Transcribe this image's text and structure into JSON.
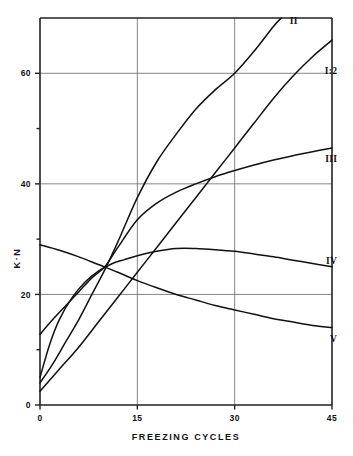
{
  "chart_data": {
    "type": "line",
    "title": "",
    "xlabel": "FREEZING CYCLES",
    "ylabel": "K·N",
    "xlim": [
      0,
      45
    ],
    "ylim": [
      0,
      70
    ],
    "grid": true,
    "legend_position": "right-inline-labels",
    "xticks": [
      {
        "value": 0,
        "label": "0"
      },
      {
        "value": 15,
        "label": "15"
      },
      {
        "value": 30,
        "label": "30"
      },
      {
        "value": 45,
        "label": "45"
      }
    ],
    "yticks": [
      {
        "value": 0,
        "label": "0"
      },
      {
        "value": 10,
        "label": ""
      },
      {
        "value": 20,
        "label": "20"
      },
      {
        "value": 30,
        "label": ""
      },
      {
        "value": 40,
        "label": "40"
      },
      {
        "value": 50,
        "label": ""
      },
      {
        "value": 60,
        "label": "60"
      }
    ],
    "gridlines_x": [
      15,
      30
    ],
    "gridlines_y": [
      20,
      40,
      60
    ],
    "series": [
      {
        "name": "II",
        "label": "II",
        "label_x": 38.5,
        "label_y": 69.5,
        "x": [
          0,
          2,
          4,
          6,
          8,
          10,
          12,
          15,
          18,
          21,
          24,
          27,
          30,
          33,
          36,
          37.2
        ],
        "values": [
          4.0,
          7.5,
          11.5,
          15.5,
          20.0,
          24.5,
          29.5,
          37.5,
          44.0,
          49.0,
          53.5,
          57.0,
          60.0,
          64.0,
          68.5,
          70.0
        ]
      },
      {
        "name": "I:2",
        "label": "I:2",
        "label_x": 45.8,
        "label_y": 60.5,
        "x": [
          0,
          3,
          6,
          9,
          12,
          15,
          18,
          21,
          24,
          27,
          30,
          33,
          36,
          39,
          42,
          45
        ],
        "values": [
          2.5,
          6.5,
          10.5,
          15.0,
          19.5,
          24.0,
          28.5,
          33.0,
          37.5,
          42.0,
          46.5,
          51.0,
          55.5,
          59.5,
          63.0,
          66.0
        ]
      },
      {
        "name": "III",
        "label": "III",
        "label_x": 45.8,
        "label_y": 44.5,
        "x": [
          0,
          2,
          4,
          6,
          8,
          10,
          12,
          15,
          18,
          21,
          24,
          27,
          30,
          33,
          36,
          39,
          42,
          45
        ],
        "values": [
          12.8,
          15.5,
          18.0,
          20.5,
          23.0,
          25.0,
          28.5,
          33.5,
          36.5,
          38.5,
          40.0,
          41.3,
          42.4,
          43.4,
          44.3,
          45.1,
          45.8,
          46.5
        ]
      },
      {
        "name": "IV",
        "label": "IV",
        "label_x": 45.8,
        "label_y": 26.2,
        "x": [
          0,
          1.5,
          3,
          5,
          7,
          9,
          11,
          13,
          15,
          18,
          21,
          24,
          27,
          30,
          33,
          36,
          39,
          42,
          45
        ],
        "values": [
          5.0,
          11.0,
          15.5,
          19.5,
          22.3,
          24.2,
          25.5,
          26.3,
          27.0,
          27.8,
          28.3,
          28.3,
          28.1,
          27.8,
          27.3,
          26.8,
          26.2,
          25.6,
          25.0
        ]
      },
      {
        "name": "V",
        "label": "V",
        "label_x": 45.8,
        "label_y": 12.0,
        "x": [
          0,
          3,
          6,
          9,
          12,
          15,
          18,
          21,
          24,
          27,
          30,
          33,
          36,
          39,
          42,
          45
        ],
        "values": [
          29.0,
          28.0,
          26.8,
          25.4,
          24.0,
          22.5,
          21.2,
          20.0,
          19.0,
          18.0,
          17.2,
          16.4,
          15.6,
          15.0,
          14.4,
          14.0
        ]
      }
    ]
  },
  "colors": {
    "curve": "#111111",
    "axis": "#222222",
    "grid": "#666666",
    "background": "#ffffff"
  }
}
